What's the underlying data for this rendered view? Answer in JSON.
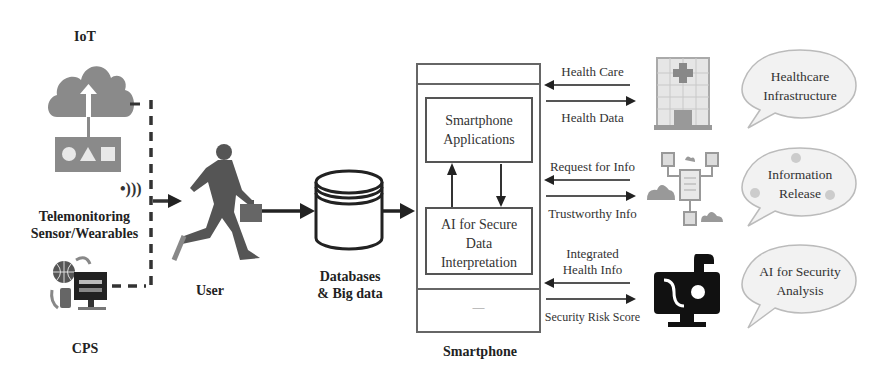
{
  "diagram": {
    "left_sources": {
      "iot": {
        "label": "IoT",
        "icon": "cloud-upload-icon"
      },
      "telemonitoring": {
        "label_line1": "Telemonitoring",
        "label_line2": "Sensor/Wearables",
        "icon": "wireless-signal-icon"
      },
      "cps": {
        "label": "CPS",
        "icon": "computer-globe-icon"
      }
    },
    "user": {
      "label": "User",
      "icon": "running-businessman-icon"
    },
    "database": {
      "label_line1": "Databases",
      "label_line2": "& Big data",
      "icon": "database-cylinder-icon"
    },
    "smartphone": {
      "label": "Smartphone",
      "apps_box": {
        "line1": "Smartphone",
        "line2": "Applications"
      },
      "ai_box": {
        "line1": "AI for Secure",
        "line2": "Data",
        "line3": "Interpretation"
      },
      "home_button": "—"
    },
    "exchanges": [
      {
        "incoming": "Health Care",
        "outgoing": "Health Data"
      },
      {
        "incoming": "Request for Info",
        "outgoing": "Trustworthy Info"
      },
      {
        "incoming_line1": "Integrated",
        "incoming_line2": "Health Info",
        "outgoing": "Security Risk Score"
      }
    ],
    "right_entities": [
      {
        "icon": "hospital-building-icon",
        "bubble_line1": "Healthcare",
        "bubble_line2": "Infrastructure"
      },
      {
        "icon": "information-network-icon",
        "bubble_line1": "Information",
        "bubble_line2": "Release"
      },
      {
        "icon": "ai-security-monitor-icon",
        "bubble_line1": "AI for Security",
        "bubble_line2": "Analysis"
      }
    ]
  }
}
